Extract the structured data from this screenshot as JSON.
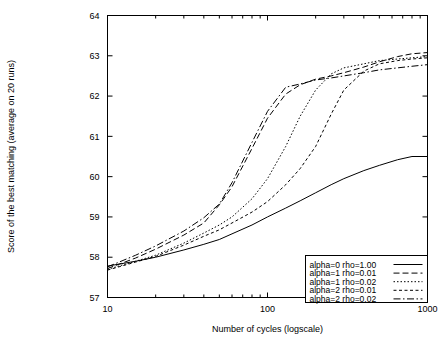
{
  "chart_data": {
    "type": "line",
    "title": "",
    "xlabel": "Number of cycles (logscale)",
    "ylabel": "Score of the best matching (average on 20 runs)",
    "xscale": "log",
    "xlim": [
      10,
      1000
    ],
    "ylim": [
      57,
      64
    ],
    "xticks": [
      "10",
      "100",
      "1000"
    ],
    "xtick_values": [
      10,
      100,
      1000
    ],
    "yticks": [
      "57",
      "58",
      "59",
      "60",
      "61",
      "62",
      "63",
      "64"
    ],
    "ytick_values": [
      57,
      58,
      59,
      60,
      61,
      62,
      63,
      64
    ],
    "grid": false,
    "legend_position": "bottom-right",
    "x": [
      10,
      15,
      20,
      30,
      40,
      50,
      60,
      80,
      100,
      130,
      160,
      200,
      250,
      300,
      400,
      500,
      650,
      800,
      1000
    ],
    "series": [
      {
        "name": "alpha=0 rho=1.00",
        "style": "solid",
        "values": [
          57.78,
          57.9,
          58.0,
          58.18,
          58.32,
          58.44,
          58.58,
          58.8,
          59.0,
          59.22,
          59.4,
          59.6,
          59.8,
          59.95,
          60.15,
          60.28,
          60.42,
          60.5,
          60.5
        ]
      },
      {
        "name": "alpha=1 rho=0.01",
        "style": "dashed",
        "values": [
          57.72,
          57.98,
          58.2,
          58.55,
          58.85,
          59.3,
          59.75,
          60.7,
          61.45,
          62.05,
          62.28,
          62.42,
          62.5,
          62.58,
          62.72,
          62.85,
          62.98,
          63.05,
          63.08
        ]
      },
      {
        "name": "alpha=1 rho=0.02",
        "style": "dotted",
        "values": [
          57.7,
          57.9,
          58.05,
          58.35,
          58.6,
          58.8,
          59.0,
          59.45,
          59.95,
          60.75,
          61.5,
          62.15,
          62.55,
          62.7,
          62.8,
          62.88,
          62.92,
          62.95,
          62.98
        ]
      },
      {
        "name": "alpha=2 rho=0.01",
        "style": "fine-dashed",
        "values": [
          57.68,
          57.88,
          58.02,
          58.3,
          58.52,
          58.68,
          58.85,
          59.12,
          59.38,
          59.8,
          60.2,
          60.75,
          61.55,
          62.15,
          62.62,
          62.8,
          62.88,
          62.92,
          62.95
        ]
      },
      {
        "name": "alpha=2 rho=0.02",
        "style": "dash-dot",
        "values": [
          57.76,
          58.05,
          58.28,
          58.65,
          58.98,
          59.32,
          59.85,
          60.85,
          61.62,
          62.22,
          62.3,
          62.4,
          62.45,
          62.5,
          62.58,
          62.65,
          62.7,
          62.74,
          62.78
        ]
      }
    ]
  }
}
